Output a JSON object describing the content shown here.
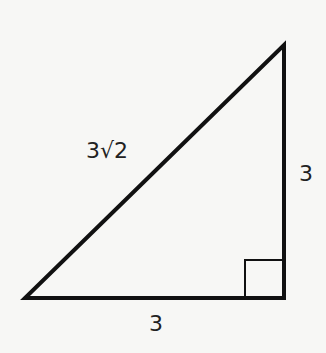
{
  "diagram": {
    "type": "right-triangle",
    "vertices": {
      "bottom_left": [
        25,
        298
      ],
      "bottom_right": [
        284,
        298
      ],
      "top": [
        284,
        45
      ]
    },
    "right_angle_vertex": "bottom_right",
    "stroke_color": "#111111",
    "labels": {
      "hypotenuse": "3√2",
      "vertical_leg": "3",
      "horizontal_leg": "3"
    }
  }
}
